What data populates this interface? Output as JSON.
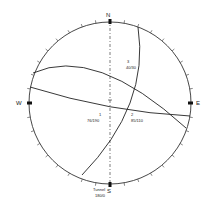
{
  "diagram": {
    "type": "stereonet",
    "compass": {
      "north": "N",
      "east": "E",
      "south": "S",
      "west": "W"
    },
    "tick_interval_deg": 10,
    "planes": [
      {
        "id": "1",
        "label_number": "1",
        "label_value": "76/190"
      },
      {
        "id": "2",
        "label_number": "2",
        "label_value": "85/110"
      },
      {
        "id": "3",
        "label_number": "3",
        "label_value": "40/30"
      }
    ],
    "tunnel": {
      "label": "Tunnel",
      "value": "180/0"
    },
    "colors": {
      "line": "#222222",
      "background": "#ffffff"
    }
  }
}
